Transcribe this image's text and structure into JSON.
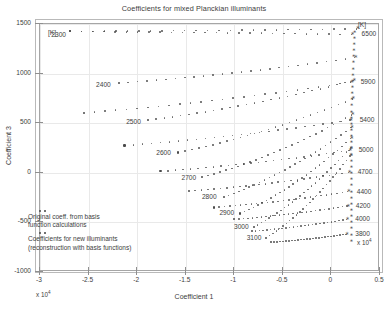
{
  "chart_data": {
    "type": "scatter",
    "title": "Coefficients for mixed Planckian illuminants",
    "xlabel": "Coefficient 1",
    "ylabel": "Coefficient 3",
    "xlim": [
      -30000,
      5000
    ],
    "ylim": [
      -1000,
      1500
    ],
    "x_exponent": "x 10",
    "x_exponent_power": "4",
    "xticks": [
      -3,
      -2.5,
      -2,
      -1.5,
      -1,
      -0.5,
      0,
      0.5
    ],
    "xtick_labels": [
      "-3",
      "-2.5",
      "-2",
      "-1.5",
      "-1",
      "-0.5",
      "0",
      "0.5"
    ],
    "yticks": [
      -1000,
      -500,
      0,
      500,
      1000,
      1500
    ],
    "ytick_labels": [
      "-1000",
      "-500",
      "0",
      "500",
      "1000",
      "1500"
    ],
    "grid": true,
    "unit_header_left": "[K]",
    "unit_header_right": "[K]",
    "legend": {
      "position": "lower-left-inside",
      "entries": [
        {
          "marker": "asterisk",
          "label_line1": "Original coeff. from basis",
          "label_line2": "function calculations"
        },
        {
          "marker": "dot",
          "label_line1": "Coefficients for new illuminants",
          "label_line2": "(reconstruction with basis functions)"
        }
      ]
    },
    "series": [
      {
        "name": "2300",
        "label_side": "left",
        "label_x": -27800,
        "label_y": 1380,
        "start_x": -26900,
        "start_y": 1425,
        "end_x": 2600,
        "end_y": 1450
      },
      {
        "name": "2400",
        "label_side": "left",
        "label_x": -23200,
        "label_y": 870,
        "start_x": -21900,
        "start_y": 905,
        "end_x": 2400,
        "end_y": 1160
      },
      {
        "name": "2500",
        "label_side": "left",
        "label_x": -20100,
        "label_y": 505,
        "start_x": -18900,
        "start_y": 530,
        "end_x": 2250,
        "end_y": 930
      },
      {
        "name": "2600",
        "label_side": "left",
        "label_x": -17000,
        "label_y": 185,
        "start_x": -15800,
        "start_y": 205,
        "end_x": 2150,
        "end_y": 745
      },
      {
        "name": "2700",
        "label_side": "left",
        "label_x": -14400,
        "label_y": -60,
        "start_x": -13300,
        "start_y": -45,
        "end_x": 2080,
        "end_y": 585
      },
      {
        "name": "2800",
        "label_side": "left",
        "label_x": -12300,
        "label_y": -255,
        "start_x": -11100,
        "start_y": -245,
        "end_x": 2020,
        "end_y": 455
      },
      {
        "name": "2900",
        "label_side": "left",
        "label_x": -10500,
        "label_y": -420,
        "start_x": -9400,
        "start_y": -410,
        "end_x": 1980,
        "end_y": 345
      },
      {
        "name": "3000",
        "label_side": "left",
        "label_x": -9000,
        "label_y": -555,
        "start_x": -8000,
        "start_y": -545,
        "end_x": 1940,
        "end_y": 250
      },
      {
        "name": "3100",
        "label_side": "left",
        "label_x": -7700,
        "label_y": -665,
        "start_x": -6700,
        "start_y": -655,
        "end_x": 1900,
        "end_y": 170
      },
      {
        "name": "3800",
        "label_side": "right",
        "label_x": 2250,
        "label_y": -630,
        "start_x": -6200,
        "start_y": -700,
        "end_x": 1500,
        "end_y": -620
      },
      {
        "name": "4000",
        "label_side": "right",
        "label_x": 2250,
        "label_y": -480,
        "start_x": -8200,
        "start_y": -590,
        "end_x": 1560,
        "end_y": -470
      },
      {
        "name": "4200",
        "label_side": "right",
        "label_x": 2300,
        "label_y": -345,
        "start_x": -10000,
        "start_y": -470,
        "end_x": 1620,
        "end_y": -335
      },
      {
        "name": "4400",
        "label_side": "right",
        "label_x": 2400,
        "label_y": -200,
        "start_x": -12100,
        "start_y": -350,
        "end_x": 1680,
        "end_y": -190
      },
      {
        "name": "4700",
        "label_side": "right",
        "label_x": 2500,
        "label_y": -5,
        "start_x": -14700,
        "start_y": -185,
        "end_x": 1760,
        "end_y": 5
      },
      {
        "name": "5000",
        "label_side": "right",
        "label_x": 2600,
        "label_y": 215,
        "start_x": -17600,
        "start_y": 15,
        "end_x": 1830,
        "end_y": 225
      },
      {
        "name": "5400",
        "label_side": "right",
        "label_x": 2700,
        "label_y": 520,
        "start_x": -21300,
        "start_y": 275,
        "end_x": 1900,
        "end_y": 530
      },
      {
        "name": "5900",
        "label_side": "right",
        "label_x": 2800,
        "label_y": 905,
        "start_x": -25500,
        "start_y": 605,
        "end_x": 1980,
        "end_y": 915
      },
      {
        "name": "6500",
        "label_side": "right",
        "label_x": 2900,
        "label_y": 1385,
        "start_x": -26900,
        "start_y": 1425,
        "end_x": 2060,
        "end_y": 1395
      }
    ]
  }
}
